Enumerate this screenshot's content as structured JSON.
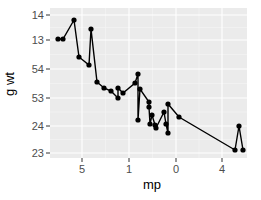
{
  "chart_data": {
    "type": "line",
    "title": "",
    "xlabel": "mp",
    "ylabel": "g wt",
    "x_ticks": [
      {
        "label": "5",
        "px": 82
      },
      {
        "label": "1",
        "px": 129
      },
      {
        "label": "0",
        "px": 176
      },
      {
        "label": "4",
        "px": 222
      }
    ],
    "y_ticks": [
      {
        "label": "14",
        "px": 15
      },
      {
        "label": "13",
        "px": 40
      },
      {
        "label": "54",
        "px": 69
      },
      {
        "label": "53",
        "px": 98
      },
      {
        "label": "24",
        "px": 126
      },
      {
        "label": "23",
        "px": 153
      }
    ],
    "grid": true,
    "legend": "none",
    "points_px": [
      [
        58,
        39
      ],
      [
        63,
        39
      ],
      [
        74,
        20
      ],
      [
        79,
        57
      ],
      [
        89,
        65
      ],
      [
        91,
        29
      ],
      [
        97,
        82
      ],
      [
        104,
        88
      ],
      [
        111,
        91
      ],
      [
        118,
        98
      ],
      [
        118,
        88
      ],
      [
        123,
        93
      ],
      [
        135,
        83
      ],
      [
        138,
        74
      ],
      [
        138,
        120
      ],
      [
        140,
        89
      ],
      [
        149,
        102
      ],
      [
        149,
        107
      ],
      [
        150,
        124
      ],
      [
        152,
        115
      ],
      [
        155,
        125
      ],
      [
        156,
        128
      ],
      [
        164,
        112
      ],
      [
        166,
        124
      ],
      [
        168,
        133
      ],
      [
        168,
        104
      ],
      [
        179,
        117
      ],
      [
        235,
        150
      ],
      [
        239,
        126
      ],
      [
        243,
        150
      ]
    ]
  }
}
